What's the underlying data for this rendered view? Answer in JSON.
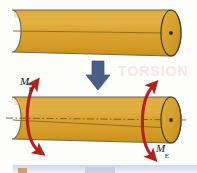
{
  "figure": {
    "background_color": "#fdfdfb"
  },
  "colors": {
    "cylinder_body": "#d9a22e",
    "cylinder_body_light": "#e0ad3c",
    "cylinder_body_dark": "#c4901f",
    "cylinder_outline": "#6d6650",
    "cylinder_end_outline": "#3b3a33",
    "axis_line": "#7a6a2a",
    "torque_arrow": "#b0211f",
    "transition_arrow": "#4a5f86",
    "center_dot": "#2b2b2b",
    "bottom_strip": "#c9d8ea"
  },
  "top_shaft": {
    "name": "undeformed-shaft",
    "description": "Straight circular cylinder with visible right end face and center point"
  },
  "transition": {
    "name": "downward-arrow",
    "glyph": "arrow-down",
    "description": "Thick downward block arrow between the two shafts"
  },
  "bottom_shaft": {
    "name": "twisted-shaft",
    "description": "Same cylinder with dash-dot center axis and curved torque arrows at both ends"
  },
  "labels": {
    "moment_left": {
      "symbol": "M",
      "subscript": "E"
    },
    "moment_right": {
      "symbol": "M",
      "subscript": "E"
    }
  },
  "ghost_text": "TORSION",
  "bottom_strip": {
    "name": "page-edge-strip"
  }
}
